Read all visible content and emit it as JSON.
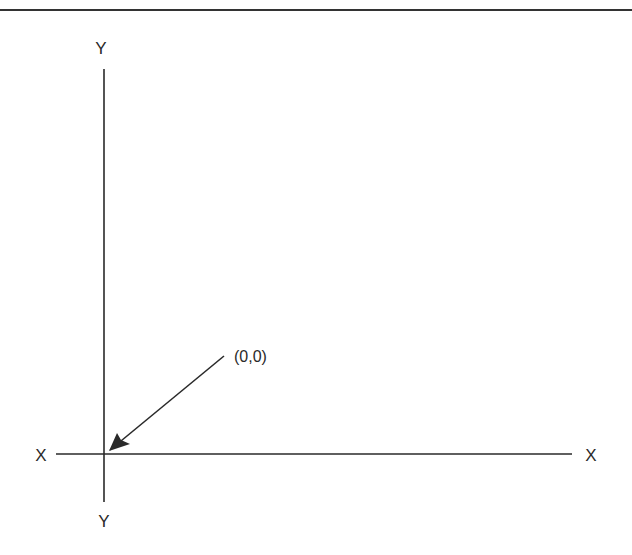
{
  "diagram": {
    "labels": {
      "y_top": "Y",
      "y_bottom": "Y",
      "x_left": "X",
      "x_right": "X",
      "origin": "(0,0)"
    },
    "colors": {
      "line": "#2a2a2a",
      "background": "#ffffff"
    }
  }
}
